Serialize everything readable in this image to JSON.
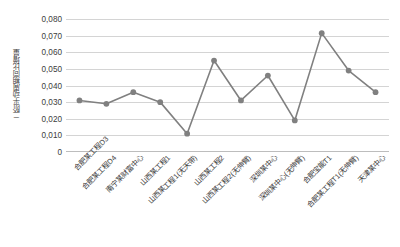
{
  "chart_data": {
    "type": "line",
    "title": "",
    "subtitle": "",
    "xlabel": "",
    "ylabel": "二阶平动周期同比增量",
    "ylim": [
      0,
      0.08
    ],
    "ytick_step": 0.01,
    "ytick_labels": [
      "0,080",
      "0,070",
      "0,060",
      "0,050",
      "0,040",
      "0,030",
      "0,020",
      "0,010",
      "0"
    ],
    "ytick_values": [
      0.08,
      0.07,
      0.06,
      0.05,
      0.04,
      0.03,
      0.02,
      0.01,
      0
    ],
    "grid": true,
    "legend": false,
    "legend_position": "none",
    "series_color": "#808080",
    "marker_color": "#808080",
    "marker_shape": "circle",
    "categories": [
      "合肥某工程D3",
      "合肥某工程D4",
      "南宁某财富中心",
      "山西某工程1",
      "山西某工程1(无天带)",
      "山西某工程2",
      "山西某工程2(无伸臂)",
      "深圳某中心",
      "深圳某中心(无伸臂)",
      "合肥宝能T1",
      "合肥某工程T1(无伸臂)",
      "天津某中心"
    ],
    "values": [
      0.031,
      0.029,
      0.036,
      0.03,
      0.011,
      0.055,
      0.031,
      0.046,
      0.019,
      0.0715,
      0.049,
      0.036
    ]
  }
}
